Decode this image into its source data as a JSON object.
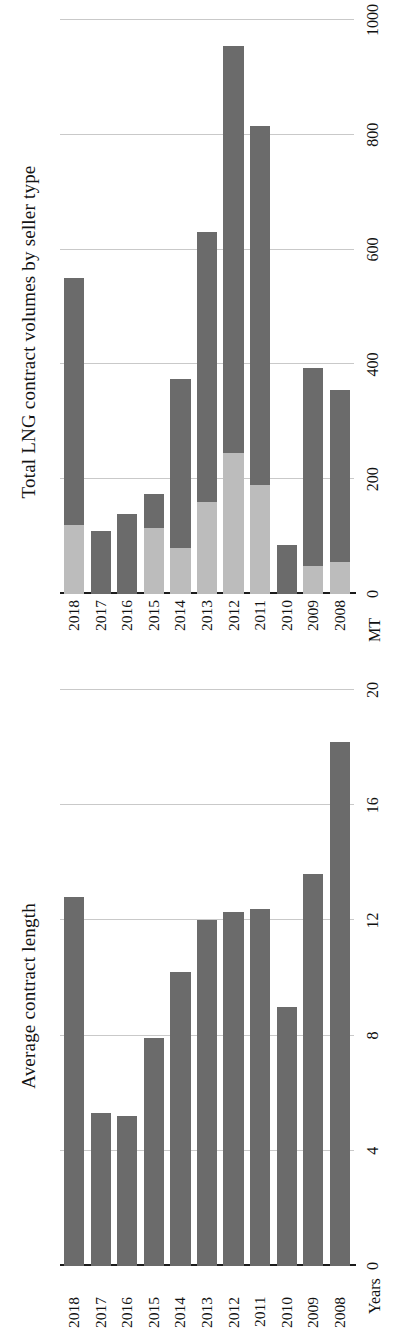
{
  "figure": {
    "orientation": "page rotated 90 degrees counter-clockwise",
    "panels": [
      "Average contract length",
      "Total LNG contract volumes by seller type"
    ]
  },
  "left_panel": {
    "title": "Average contract length",
    "unit_label": "Years",
    "tick_labels": [
      "0",
      "4",
      "8",
      "12",
      "16",
      "20"
    ],
    "category_labels": [
      "2008",
      "2009",
      "2010",
      "2011",
      "2012",
      "2013",
      "2014",
      "2015",
      "2016",
      "2017",
      "2018"
    ]
  },
  "right_panel": {
    "title": "Total LNG contract volumes by seller type",
    "unit_label": "MT",
    "tick_labels": [
      "0",
      "200",
      "400",
      "600",
      "800",
      "1000"
    ],
    "category_labels": [
      "2008",
      "2009",
      "2010",
      "2011",
      "2012",
      "2013",
      "2014",
      "2015",
      "2016",
      "2017",
      "2018"
    ]
  },
  "colors": {
    "series_dark": "#6b6b6b",
    "series_light": "#bcbcbc",
    "gridline": "#c9c9c9",
    "axis": "#1a1a1a",
    "text": "#111111",
    "background": "#ffffff"
  },
  "chart_data": [
    {
      "type": "bar",
      "title": "Average contract length",
      "orientation": "horizontal",
      "xlabel": "",
      "ylabel": "Years",
      "ylim": [
        0,
        20
      ],
      "yticks": [
        0,
        4,
        8,
        12,
        16,
        20
      ],
      "grid": true,
      "legend": "none",
      "categories": [
        "2008",
        "2009",
        "2010",
        "2011",
        "2012",
        "2013",
        "2014",
        "2015",
        "2016",
        "2017",
        "2018"
      ],
      "values": [
        18.2,
        13.6,
        9.0,
        12.4,
        12.3,
        12.0,
        10.2,
        7.9,
        5.2,
        5.3,
        12.8
      ]
    },
    {
      "type": "bar",
      "title": "Total LNG contract volumes by seller type",
      "orientation": "horizontal",
      "stacked": true,
      "xlabel": "",
      "ylabel": "MT",
      "ylim": [
        0,
        1000
      ],
      "yticks": [
        0,
        200,
        400,
        600,
        800,
        1000
      ],
      "grid": true,
      "legend": "none",
      "categories": [
        "2008",
        "2009",
        "2010",
        "2011",
        "2012",
        "2013",
        "2014",
        "2015",
        "2016",
        "2017",
        "2018"
      ],
      "series": [
        {
          "name": "light-segment",
          "values": [
            55,
            48,
            0,
            190,
            245,
            160,
            80,
            115,
            0,
            0,
            120
          ]
        },
        {
          "name": "dark-segment",
          "values": [
            300,
            345,
            85,
            625,
            710,
            470,
            295,
            60,
            140,
            110,
            430
          ]
        }
      ],
      "totals": [
        355,
        393,
        85,
        815,
        955,
        630,
        375,
        175,
        140,
        110,
        550
      ]
    }
  ]
}
